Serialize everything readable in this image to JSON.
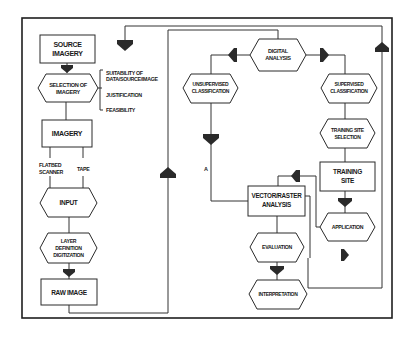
{
  "diagram": {
    "type": "flowchart",
    "nodes": {
      "source_imagery": {
        "lines": [
          "SOURCE",
          "IMAGERY"
        ],
        "shape": "box"
      },
      "selection_of_imagery": {
        "lines": [
          "SELECTION OF",
          "IMAGERY"
        ],
        "shape": "hexagon"
      },
      "imagery": {
        "lines": [
          "IMAGERY"
        ],
        "shape": "box"
      },
      "input": {
        "lines": [
          "INPUT"
        ],
        "shape": "hexagon"
      },
      "layer_definition": {
        "lines": [
          "LAYER",
          "DEFINITION",
          "DIGITIZATION"
        ],
        "shape": "hexagon"
      },
      "raw_image": {
        "lines": [
          "RAW IMAGE"
        ],
        "shape": "box"
      },
      "digital_analysis": {
        "lines": [
          "DIGITAL",
          "ANALYSIS"
        ],
        "shape": "hexagon"
      },
      "unsupervised_classification": {
        "lines": [
          "UNSUPERVISED",
          "CLASSIFICATION"
        ],
        "shape": "hexagon"
      },
      "supervised_classification": {
        "lines": [
          "SUPERVISED",
          "CLASSIFICATION"
        ],
        "shape": "hexagon"
      },
      "training_site_selection": {
        "lines": [
          "TRAINING SITE",
          "SELECTION"
        ],
        "shape": "hexagon"
      },
      "training_site": {
        "lines": [
          "TRAINING",
          "SITE"
        ],
        "shape": "box"
      },
      "vector_raster_analysis": {
        "lines": [
          "VECTOR/RASTER",
          "ANALYSIS"
        ],
        "shape": "box"
      },
      "application": {
        "lines": [
          "APPLICATION"
        ],
        "shape": "hexagon"
      },
      "evaluation": {
        "lines": [
          "EVALUATION"
        ],
        "shape": "hexagon"
      },
      "interpretation": {
        "lines": [
          "INTERPRETATION"
        ],
        "shape": "hexagon"
      }
    },
    "selection_criteria": {
      "suitability": [
        "SUITABILITY OF",
        "DATA/SOURCE/IMAGE"
      ],
      "justification": "JUSTIFICATION",
      "feasibility": "FEASIBILITY"
    },
    "input_sources": {
      "flatbed": [
        "FLATBED",
        "SCANNER"
      ],
      "tape": "TAPE"
    },
    "connector_label": "A",
    "colors": {
      "stroke": "#2a2a2a",
      "arrow": "#2a2a2a",
      "background": "#ffffff"
    }
  }
}
